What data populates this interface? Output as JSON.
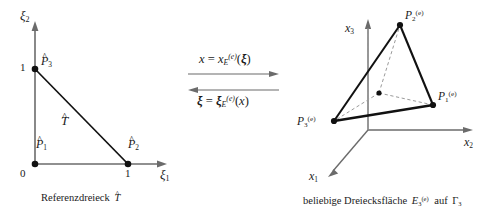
{
  "figure": {
    "type": "math-diagram"
  },
  "left_panel": {
    "name": "reference-triangle",
    "axes": {
      "x_axis_label": "ξ",
      "x_axis_sub": "1",
      "y_axis_label": "ξ",
      "y_axis_sub": "2"
    },
    "ticks": {
      "origin": "0",
      "x_one": "1",
      "y_one": "1"
    },
    "region_label": "T",
    "vertices": [
      {
        "label": "P",
        "sub": "1",
        "x": 0,
        "y": 0
      },
      {
        "label": "P",
        "sub": "2",
        "x": 1,
        "y": 0
      },
      {
        "label": "P",
        "sub": "3",
        "x": 0,
        "y": 1
      }
    ],
    "caption_text": "Referenzdreieck",
    "caption_symbol": "T"
  },
  "middle_panel": {
    "name": "mapping-arrows",
    "forward": {
      "lhs": "x",
      "eq": "=",
      "fn": "x",
      "fn_sub": "E",
      "fn_sup": "(e)",
      "arg_open": "(",
      "arg": "ξ",
      "arg_close": ")"
    },
    "backward": {
      "lhs": "ξ",
      "eq": "=",
      "fn": "ξ",
      "fn_sub": "E",
      "fn_sup": "(e)",
      "arg_open": "(",
      "arg": "x",
      "arg_close": ")"
    }
  },
  "right_panel": {
    "name": "triangular-surface-element",
    "axes": {
      "x1_label": "x",
      "x1_sub": "1",
      "x2_label": "x",
      "x2_sub": "2",
      "x3_label": "x",
      "x3_sub": "3"
    },
    "vertices": [
      {
        "label": "P",
        "sub": "1",
        "sup": "(e)"
      },
      {
        "label": "P",
        "sub": "2",
        "sup": "(e)"
      },
      {
        "label": "P",
        "sub": "3",
        "sup": "(e)"
      }
    ],
    "caption_prefix": "beliebige Dreiecksfläche",
    "caption_symbol": "E",
    "caption_symbol_sub": "3",
    "caption_symbol_sup": "(e)",
    "caption_middle": "auf",
    "caption_gamma": "Γ",
    "caption_gamma_sub": "3"
  },
  "colors": {
    "background": "#ffffff",
    "ink": "#1a1a1a",
    "axis": "#6b6b6b",
    "edge": "#111111",
    "dashed": "#9a9a9a"
  }
}
